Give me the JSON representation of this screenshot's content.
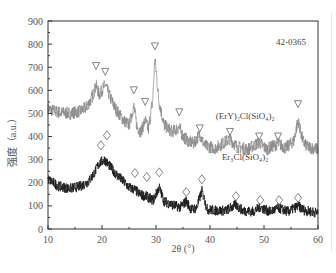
{
  "chart_data": {
    "type": "line",
    "title": "",
    "xlabel": "2θ (°)",
    "ylabel": "强度（a.u.）",
    "xlim": [
      10,
      60
    ],
    "ylim": [
      0,
      900
    ],
    "xticks": [
      10,
      20,
      30,
      40,
      50,
      60
    ],
    "yticks": [
      0,
      100,
      200,
      300,
      400,
      500,
      600,
      700,
      800,
      900
    ],
    "grid": false,
    "reference_card": "42-0365",
    "series": [
      {
        "name": "(ErY)₂Cl(SiO₄)₂",
        "color": "#8a8a8a",
        "marker_symbol": "triangle-down",
        "x": [
          10,
          12,
          14,
          16,
          17,
          18,
          18.9,
          19.5,
          20.6,
          21.5,
          22.5,
          24,
          25,
          25.9,
          26.5,
          27.2,
          28.0,
          28.6,
          29.4,
          29.8,
          30.5,
          31.5,
          33,
          34.3,
          35,
          36,
          37,
          38.1,
          39,
          41,
          43.7,
          45,
          47,
          49.1,
          50.5,
          52.6,
          54,
          55.5,
          56.3,
          57.2,
          58,
          60
        ],
        "values": [
          520,
          505,
          500,
          510,
          525,
          560,
          620,
          580,
          625,
          570,
          520,
          470,
          450,
          530,
          440,
          420,
          470,
          430,
          560,
          740,
          560,
          450,
          420,
          440,
          400,
          380,
          370,
          410,
          360,
          350,
          390,
          355,
          345,
          375,
          345,
          370,
          350,
          380,
          470,
          380,
          355,
          345
        ]
      },
      {
        "name": "Er₃Cl(SiO₄)₂",
        "color": "#1a1a1a",
        "marker_symbol": "diamond",
        "x": [
          10,
          12,
          14,
          16,
          17.5,
          18.5,
          19.5,
          20.5,
          21.5,
          22.5,
          24,
          25,
          26.1,
          27,
          28.3,
          29.5,
          30.6,
          31.5,
          33,
          34.5,
          35.6,
          36.5,
          37.5,
          38.5,
          39.5,
          41,
          43,
          44.8,
          46,
          48,
          49.3,
          51,
          52.8,
          54.5,
          56.3,
          57.5,
          60
        ],
        "values": [
          215,
          185,
          175,
          185,
          205,
          240,
          285,
          300,
          270,
          240,
          205,
          180,
          170,
          150,
          140,
          125,
          180,
          120,
          105,
          95,
          120,
          85,
          90,
          165,
          85,
          80,
          80,
          105,
          80,
          75,
          95,
          75,
          90,
          75,
          100,
          80,
          70
        ]
      }
    ],
    "markers": {
      "triangle_positions": [
        18.9,
        20.6,
        25.9,
        28.0,
        29.8,
        34.3,
        38.1,
        43.7,
        49.1,
        52.6,
        56.3
      ],
      "triangle_levels": [
        705,
        680,
        600,
        550,
        790,
        505,
        435,
        420,
        400,
        400,
        540
      ],
      "diamond_positions": [
        19.8,
        20.9,
        26.1,
        28.3,
        30.6,
        35.6,
        38.5,
        44.8,
        49.3,
        52.8,
        56.3
      ],
      "diamond_levels": [
        362,
        405,
        242,
        225,
        245,
        160,
        215,
        142,
        125,
        125,
        135
      ]
    },
    "annotations": [
      {
        "text": "42-0365",
        "x": 55,
        "y": 795
      },
      {
        "text": "(ErY)₂Cl(SiO₄)₂",
        "x": 46.5,
        "y": 478
      },
      {
        "text": "Er₃Cl(SiO₄)₂",
        "x": 46.5,
        "y": 300
      }
    ]
  }
}
